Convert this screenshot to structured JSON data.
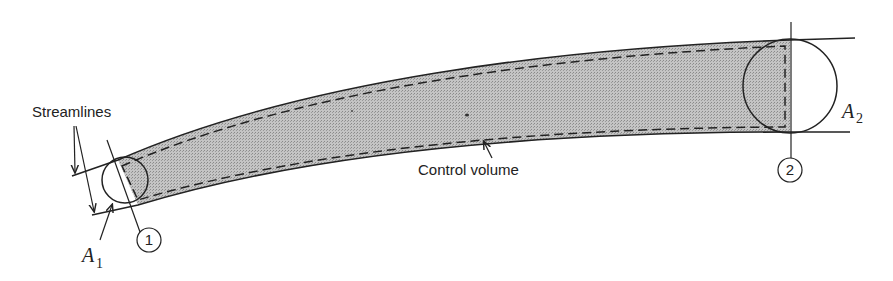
{
  "figure": {
    "type": "control-volume-streamtube-diagram",
    "labels": {
      "streamlines": "Streamlines",
      "control_volume": "Control volume",
      "area1_symbol": "A",
      "area1_sub": "1",
      "area2_symbol": "A",
      "area2_sub": "2",
      "section1": "1",
      "section2": "2"
    },
    "colors": {
      "fill": "#b8b8b8",
      "stroke": "#222222",
      "background": "#ffffff"
    }
  }
}
